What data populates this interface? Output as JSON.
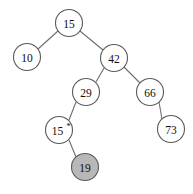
{
  "figure": {
    "name": "binary-search-tree",
    "width": 193,
    "height": 194,
    "background_color": "#ffffff"
  },
  "style": {
    "node_stroke_color": "#5a5a5a",
    "edge_stroke_color": "#6e6e6e",
    "node_fill_default": "#ffffff",
    "node_fill_highlight": "#b8b8b8",
    "label_color": "#0d0d0d",
    "node_radius": 13.5
  },
  "chart_data": {
    "type": "diagram",
    "diagram_kind": "binary-search-tree",
    "title": "",
    "nodes": [
      {
        "id": "n15root",
        "label": "15",
        "mark": "",
        "x": 69,
        "y": 23,
        "r": 13.5,
        "fill": "#ffffff",
        "highlighted": false
      },
      {
        "id": "n10",
        "label": "10",
        "mark": "",
        "x": 27,
        "y": 57,
        "r": 13.5,
        "fill": "#ffffff",
        "highlighted": false
      },
      {
        "id": "n42",
        "label": "42",
        "mark": "",
        "x": 114,
        "y": 58,
        "r": 13.5,
        "fill": "#ffffff",
        "highlighted": false
      },
      {
        "id": "n29",
        "label": "29",
        "mark": "",
        "x": 86,
        "y": 92,
        "r": 13.5,
        "fill": "#ffffff",
        "highlighted": false
      },
      {
        "id": "n66",
        "label": "66",
        "mark": "",
        "x": 150,
        "y": 92,
        "r": 13.5,
        "fill": "#ffffff",
        "highlighted": false
      },
      {
        "id": "n15dup",
        "label": "15",
        "mark": "*",
        "x": 59,
        "y": 130,
        "r": 13.5,
        "fill": "#ffffff",
        "highlighted": false
      },
      {
        "id": "n73",
        "label": "73",
        "mark": "",
        "x": 171,
        "y": 129,
        "r": 13.5,
        "fill": "#ffffff",
        "highlighted": false
      },
      {
        "id": "n19",
        "label": "19",
        "mark": "",
        "x": 85,
        "y": 167,
        "r": 13.5,
        "fill": "#b8b8b8",
        "highlighted": true
      }
    ],
    "edges": [
      {
        "from": "n15root",
        "to": "n10",
        "x1": 58,
        "y1": 31,
        "x2": 38,
        "y2": 49
      },
      {
        "from": "n15root",
        "to": "n42",
        "x1": 80,
        "y1": 31,
        "x2": 103,
        "y2": 50
      },
      {
        "from": "n42",
        "to": "n29",
        "x1": 104,
        "y1": 68,
        "x2": 96,
        "y2": 82
      },
      {
        "from": "n42",
        "to": "n66",
        "x1": 124,
        "y1": 67,
        "x2": 140,
        "y2": 83
      },
      {
        "from": "n29",
        "to": "n15dup",
        "x1": 76,
        "y1": 102,
        "x2": 69,
        "y2": 120
      },
      {
        "from": "n66",
        "to": "n73",
        "x1": 159,
        "y1": 102,
        "x2": 162,
        "y2": 119
      },
      {
        "from": "n15dup",
        "to": "n19",
        "x1": 69,
        "y1": 140,
        "x2": 76,
        "y2": 157
      }
    ],
    "legend": [],
    "annotations": []
  }
}
